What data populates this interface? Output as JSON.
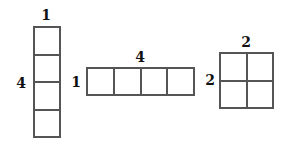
{
  "figures": [
    {
      "name": "vertical-strip",
      "rows": 4,
      "cols": 1,
      "top_label": "1",
      "side_label": "4"
    },
    {
      "name": "horizontal-strip",
      "rows": 1,
      "cols": 4,
      "top_label": "4",
      "side_label": "1"
    },
    {
      "name": "square-grid",
      "rows": 2,
      "cols": 2,
      "top_label": "2",
      "side_label": "2"
    }
  ]
}
